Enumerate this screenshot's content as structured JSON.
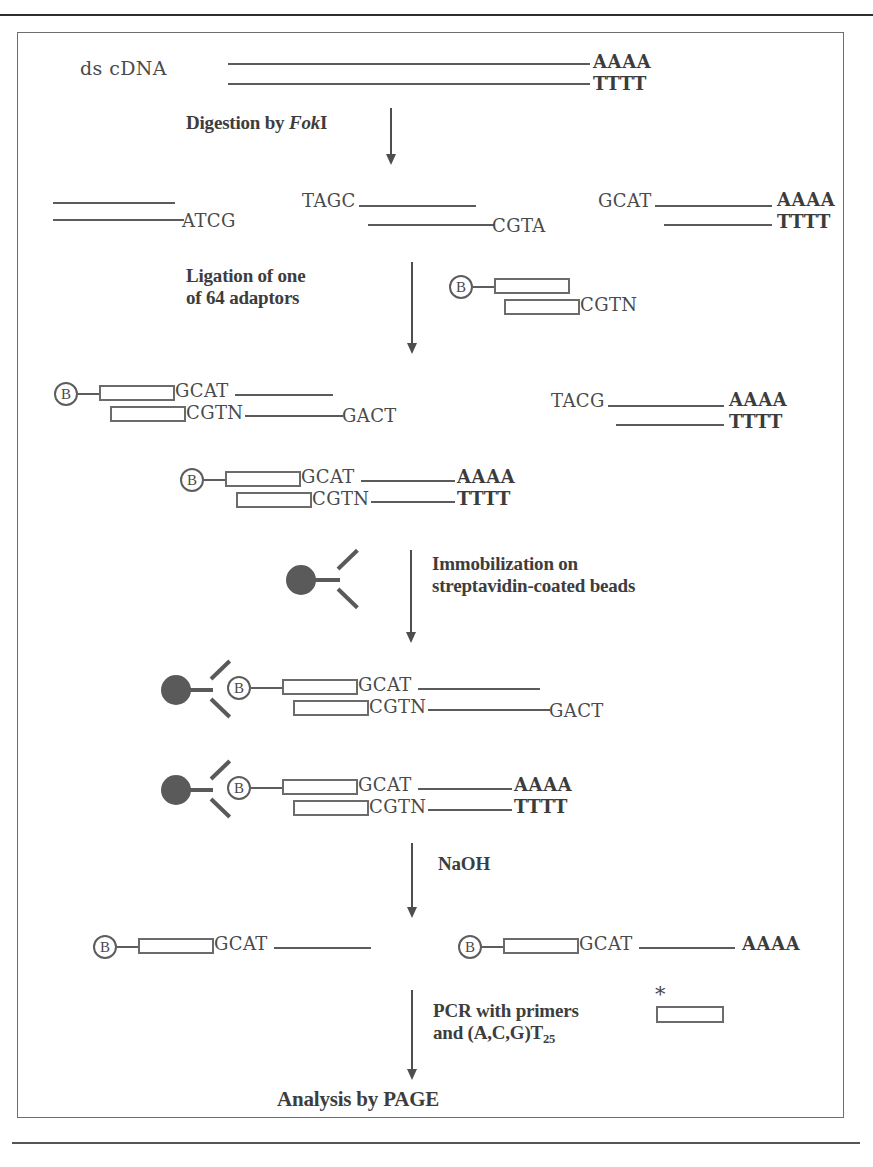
{
  "page": {
    "clipped_header_text": "",
    "accent_color": "#5a5a5a",
    "line_color": "#5b5b5b",
    "text_color": "#3d3d3d"
  },
  "figure": {
    "steps": [
      {
        "id": "digestion",
        "label": "Digestion by FokI"
      },
      {
        "id": "ligation",
        "label": "Ligation of one\nof 64 adaptors"
      },
      {
        "id": "immobilization",
        "label": "Immobilization on\nstreptavidin-coated beads"
      },
      {
        "id": "naoh",
        "label": "NaOH"
      },
      {
        "id": "pcr",
        "label": "PCR with primers\nand (A,C,G)T25"
      },
      {
        "id": "analysis",
        "label": "Analysis by PAGE"
      }
    ],
    "step_digestion": {
      "prefix": "Digestion by ",
      "enzyme_italic": "Fok",
      "enzyme_roman": "I"
    },
    "step_pcr": {
      "line1": "PCR with primers",
      "line2_prefix": "and (A,C,G)T",
      "line2_subscript": "25"
    },
    "step_ligation": {
      "line1": "Ligation of one",
      "line2": "of 64 adaptors"
    },
    "step_immobilization": {
      "line1": "Immobilization on",
      "line2": "streptavidin-coated beads"
    },
    "step_naoh": {
      "label": "NaOH"
    },
    "step_analysis": {
      "label": "Analysis by PAGE"
    }
  },
  "row_dscdna": {
    "label": "ds cDNA",
    "top_tail": "AAAA",
    "bottom_tail": "TTTT"
  },
  "row_fragments": {
    "left": {
      "bottom_tail": "ATCG"
    },
    "middle": {
      "top_head": "TAGC",
      "bottom_tail": "CGTA"
    },
    "right": {
      "top_head": "GCAT",
      "top_tail": "AAAA",
      "bottom_tail": "TTTT"
    }
  },
  "adaptor": {
    "biotin_letter": "B",
    "bottom_overhang": "CGTN"
  },
  "row_ligated": {
    "left": {
      "biotin_letter": "B",
      "top_seq": "GCAT",
      "bottom_seq": "CGTN",
      "bottom_tail": "GACT"
    },
    "right": {
      "top_head": "TACG",
      "top_tail": "AAAA",
      "bottom_tail": "TTTT"
    },
    "center": {
      "biotin_letter": "B",
      "top_seq": "GCAT",
      "top_tail": "AAAA",
      "bottom_seq": "CGTN",
      "bottom_tail": "TTTT"
    }
  },
  "bead_symbol": {
    "name": "streptavidin-coated bead"
  },
  "row_immobilized": {
    "first": {
      "biotin_letter": "B",
      "top_seq": "GCAT",
      "bottom_seq": "CGTN",
      "bottom_tail": "GACT"
    },
    "second": {
      "biotin_letter": "B",
      "top_seq": "GCAT",
      "top_tail": "AAAA",
      "bottom_seq": "CGTN",
      "bottom_tail": "TTTT"
    }
  },
  "row_single_strands": {
    "left": {
      "biotin_letter": "B",
      "seq": "GCAT"
    },
    "right": {
      "biotin_letter": "B",
      "seq": "GCAT",
      "tail": "AAAA"
    }
  },
  "primer": {
    "asterisk": "*"
  }
}
